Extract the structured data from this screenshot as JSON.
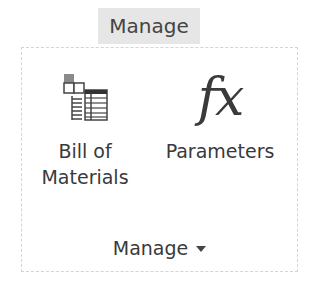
{
  "ribbon": {
    "tab_label": "Manage",
    "panel": {
      "buttons": [
        {
          "label_line1": "Bill of",
          "label_line2": "Materials",
          "icon": "bill-of-materials-icon"
        },
        {
          "label_line1": "Parameters",
          "icon": "fx-icon",
          "icon_text": "fx"
        }
      ],
      "group_label": "Manage",
      "group_dropdown_icon": "caret-down-icon"
    }
  }
}
